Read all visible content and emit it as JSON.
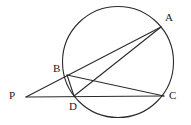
{
  "figure": {
    "kind": "circle-geometry-diagram",
    "width": 191,
    "height": 125,
    "background_color": "#ffffff",
    "stroke_color": "#2b2b2b",
    "label_color": "#1a1a1a",
    "stroke_width": 1.1
  },
  "circle": {
    "name": "main-circle",
    "cx": 118,
    "cy": 62,
    "r": 55.5
  },
  "points": [
    {
      "id": "A",
      "label": "A",
      "x": 161,
      "y": 27,
      "label_x": 165,
      "label_y": 12,
      "on_circle": true
    },
    {
      "id": "B",
      "label": "B",
      "x": 67,
      "y": 75,
      "label_x": 53,
      "label_y": 63,
      "on_circle": true
    },
    {
      "id": "C",
      "label": "C",
      "x": 164,
      "y": 96,
      "label_x": 169,
      "label_y": 90,
      "on_circle": true
    },
    {
      "id": "D",
      "label": "D",
      "x": 74,
      "y": 96,
      "label_x": 69,
      "label_y": 101,
      "on_circle": true
    },
    {
      "id": "P",
      "label": "P",
      "x": 26,
      "y": 97,
      "label_x": 9,
      "label_y": 90,
      "on_circle": false
    }
  ],
  "segments": [
    {
      "id": "PA",
      "label": "P to A secant through B",
      "x1": 26,
      "y1": 97,
      "x2": 161,
      "y2": 27
    },
    {
      "id": "PC",
      "label": "P to C secant through D",
      "x1": 26,
      "y1": 97,
      "x2": 164,
      "y2": 96
    },
    {
      "id": "BC",
      "label": "chord B to C",
      "x1": 67,
      "y1": 75,
      "x2": 164,
      "y2": 96
    },
    {
      "id": "DA",
      "label": "chord D to A",
      "x1": 74,
      "y1": 96,
      "x2": 161,
      "y2": 27
    },
    {
      "id": "BD",
      "label": "chord B to D",
      "x1": 67,
      "y1": 75,
      "x2": 74,
      "y2": 96
    }
  ]
}
